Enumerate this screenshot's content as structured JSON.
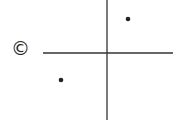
{
  "option_label": "©",
  "diagram": {
    "type": "coordinate-plane",
    "axes": {
      "x_axis": {
        "x1": 43,
        "y1": 53,
        "x2": 173,
        "y2": 53
      },
      "y_axis": {
        "x1": 107,
        "y1": 0,
        "x2": 107,
        "y2": 120
      },
      "color": "#333333"
    },
    "points": [
      {
        "quadrant": "I",
        "cx": 128,
        "cy": 19
      },
      {
        "quadrant": "III",
        "cx": 61,
        "cy": 80
      }
    ],
    "point_color": "#222222"
  }
}
